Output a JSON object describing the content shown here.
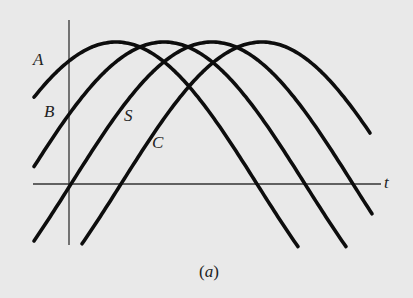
{
  "figure": {
    "caption_open": "(",
    "caption_letter": "a",
    "caption_close": ")",
    "axis_label_t": "t",
    "colors": {
      "background": "#e9e9e9",
      "curve": "#0d0d0d",
      "axis": "#333333",
      "text": "#222222"
    },
    "axes": {
      "vertical": {
        "x": 69,
        "y1": 20,
        "y2": 245
      },
      "horizontal": {
        "y": 184,
        "x1": 33,
        "x2": 381
      }
    },
    "wave": {
      "center_y": 184,
      "amplitude": 142,
      "period": 564
    },
    "curves": [
      {
        "name": "A",
        "peak_x": 116,
        "x_start": 34,
        "x_end": 298,
        "label_x": 33,
        "label_y": 51
      },
      {
        "name": "B",
        "peak_x": 164,
        "x_start": 34,
        "x_end": 347,
        "label_x": 44,
        "label_y": 103
      },
      {
        "name": "S",
        "peak_x": 212,
        "x_start": 34,
        "x_end": 372,
        "label_x": 124,
        "label_y": 107
      },
      {
        "name": "C",
        "peak_x": 262,
        "x_start": 82,
        "x_end": 370,
        "label_x": 152,
        "label_y": 134
      }
    ]
  }
}
